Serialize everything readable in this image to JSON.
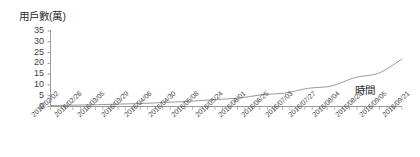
{
  "chart_data": {
    "type": "line",
    "title": "",
    "ylabel": "用戶數(萬)",
    "xlabel": "時間",
    "ylim": [
      0,
      35
    ],
    "yticks": [
      0,
      5,
      10,
      15,
      20,
      25,
      30,
      35
    ],
    "grid": false,
    "legend": null,
    "line_color": "#9a9a9a",
    "axis_color": "#9b9b9b",
    "categories": [
      "2016/02/02",
      "2016/02/26",
      "2016/03/05",
      "2016/03/29",
      "2016/04/06",
      "2016/04/30",
      "2016/05/08",
      "2016/05/24",
      "2016/06/01",
      "2016/06/25",
      "2016/07/03",
      "2016/07/27",
      "2016/08/04",
      "2016/08/28",
      "2016/09/05",
      "2016/09/21"
    ],
    "values": [
      0.2,
      0.4,
      0.6,
      0.9,
      1.2,
      1.7,
      2.2,
      3.0,
      3.6,
      5.2,
      6.0,
      8.2,
      9.3,
      13.2,
      15.2,
      21.8
    ]
  }
}
